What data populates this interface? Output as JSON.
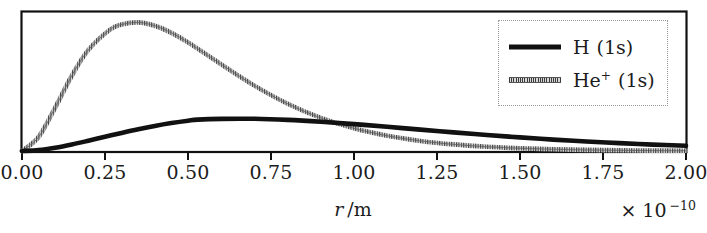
{
  "chart_data": {
    "type": "line",
    "title": "",
    "subtitle": "",
    "xlabel": "r /m",
    "xlabel_symbol": "r",
    "xlabel_unit": "/m",
    "ylabel": "",
    "x_exponent_label": "× 10",
    "x_exponent_power": "−10",
    "x_scale_factor": 1e-10,
    "xlim": [
      0.0,
      2.0
    ],
    "ylim": [
      0.0,
      1.05
    ],
    "xticks": [
      0.0,
      0.25,
      0.5,
      0.75,
      1.0,
      1.25,
      1.5,
      1.75,
      2.0
    ],
    "xticklabels": [
      "0.00",
      "0.25",
      "0.50",
      "0.75",
      "1.00",
      "1.25",
      "1.50",
      "1.75",
      "2.00"
    ],
    "yticks": [],
    "yticklabels": [],
    "grid": false,
    "legend_position": "upper right",
    "frame_visible": true,
    "series": [
      {
        "name": "H (1s)",
        "label_main": "H",
        "label_charge": "",
        "label_state": "(1s)",
        "color": "#111111",
        "linestyle": "solid",
        "linewidth": 4.2,
        "atomic_number": 1,
        "bohr_radius_angstrom": 0.529,
        "peak_x": 0.529,
        "peak_y": 0.25,
        "function": "P(r) = (4 r^2 / a^3) exp(-2 r / a),  a = a0/Z",
        "x": [
          0.0,
          0.05,
          0.1,
          0.15,
          0.2,
          0.25,
          0.3,
          0.35,
          0.4,
          0.45,
          0.5,
          0.529,
          0.6,
          0.7,
          0.8,
          0.9,
          1.0,
          1.1,
          1.2,
          1.3,
          1.4,
          1.5,
          1.6,
          1.7,
          1.8,
          1.9,
          2.0
        ],
        "y": [
          0.0,
          0.0069,
          0.0246,
          0.0491,
          0.0775,
          0.1073,
          0.1368,
          0.1646,
          0.1896,
          0.2111,
          0.2289,
          0.2367,
          0.2428,
          0.2432,
          0.2353,
          0.2212,
          0.2031,
          0.1828,
          0.1617,
          0.1408,
          0.121,
          0.1027,
          0.0863,
          0.0718,
          0.0592,
          0.0485,
          0.0394
        ]
      },
      {
        "name": "He+ (1s)",
        "label_main": "He",
        "label_charge": "+",
        "label_state": "(1s)",
        "color": "#6e6e6e",
        "linestyle": "hatched",
        "linewidth": 4.0,
        "atomic_number": 2,
        "bohr_radius_angstrom": 0.2645,
        "peak_x": 0.2645,
        "peak_y": 1.0,
        "function": "P(r) = (4 r^2 / a^3) exp(-2 r / a),  a = a0/Z",
        "x": [
          0.0,
          0.05,
          0.1,
          0.15,
          0.2,
          0.2645,
          0.3,
          0.35,
          0.4,
          0.45,
          0.5,
          0.6,
          0.7,
          0.8,
          0.9,
          1.0,
          1.1,
          1.2,
          1.3,
          1.4,
          1.5,
          1.6,
          1.7,
          1.8,
          1.9,
          2.0
        ],
        "y": [
          0.0,
          0.1057,
          0.3281,
          0.5686,
          0.7638,
          0.9157,
          0.9556,
          0.9716,
          0.9463,
          0.8927,
          0.8209,
          0.6548,
          0.4938,
          0.3572,
          0.2503,
          0.1713,
          0.1151,
          0.0762,
          0.0498,
          0.0322,
          0.0206,
          0.0131,
          0.0082,
          0.0051,
          0.0032,
          0.002
        ]
      }
    ],
    "annotations": [
      {
        "text": "curves cross",
        "x": 0.56,
        "y": 0.243
      }
    ]
  },
  "legend": {
    "entries": [
      {
        "main": "H",
        "charge": "",
        "state": "(1s)",
        "style": "solid"
      },
      {
        "main": "He",
        "charge": "+",
        "state": "(1s)",
        "style": "hatched"
      }
    ]
  },
  "colors": {
    "axis": "#111111",
    "background": "#ffffff",
    "h_curve": "#111111",
    "he_curve": "#6e6e6e",
    "text": "#1c1c1c",
    "legend_border": "#9a9a9a"
  }
}
